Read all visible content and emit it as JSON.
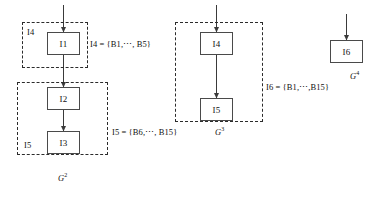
{
  "diagram": {
    "nodes": [
      {
        "id": "node-i1",
        "label": "I1",
        "x": 47,
        "y": 32,
        "w": 33,
        "h": 23
      },
      {
        "id": "node-i2",
        "label": "I2",
        "x": 47,
        "y": 87,
        "w": 33,
        "h": 23
      },
      {
        "id": "node-i3",
        "label": "I3",
        "x": 47,
        "y": 131,
        "w": 33,
        "h": 23
      },
      {
        "id": "node-i4",
        "label": "I4",
        "x": 200,
        "y": 32,
        "w": 33,
        "h": 23
      },
      {
        "id": "node-i5",
        "label": "I5",
        "x": 200,
        "y": 98,
        "w": 33,
        "h": 23
      },
      {
        "id": "node-i6",
        "label": "I6",
        "x": 330,
        "y": 40,
        "w": 33,
        "h": 23
      }
    ],
    "groups": [
      {
        "id": "group-g2-upper",
        "x": 22,
        "y": 22,
        "w": 66,
        "h": 46
      },
      {
        "id": "group-g2-lower",
        "x": 17,
        "y": 82,
        "w": 91,
        "h": 73
      },
      {
        "id": "group-g3",
        "x": 175,
        "y": 22,
        "w": 88,
        "h": 100
      }
    ],
    "inner_labels": [
      {
        "id": "inner-label-i4",
        "text": "I4",
        "x": 27,
        "y": 27
      },
      {
        "id": "inner-label-i5",
        "text": "I5",
        "x": 24,
        "y": 140
      }
    ],
    "set_labels": [
      {
        "id": "set-label-i4",
        "text": "I4 = {B1,⋯, B5}",
        "x": 90,
        "y": 39
      },
      {
        "id": "set-label-i5",
        "text": "I5 = {B6,⋯, B15}",
        "x": 112,
        "y": 127
      },
      {
        "id": "set-label-i6",
        "text": "I6 = {B1,⋯,B15}",
        "x": 266,
        "y": 82
      }
    ],
    "captions": [
      {
        "id": "caption-g2",
        "text": "G",
        "sup": "2",
        "x": 58,
        "y": 172
      },
      {
        "id": "caption-g3",
        "text": "G",
        "sup": "3",
        "x": 215,
        "y": 126
      },
      {
        "id": "caption-g4",
        "text": "G",
        "sup": "4",
        "x": 350,
        "y": 70
      }
    ],
    "arrows": [
      {
        "id": "arrow-into-i1",
        "x1": 63.5,
        "y1": 5,
        "x2": 63.5,
        "y2": 32
      },
      {
        "id": "arrow-i1-to-i2",
        "x1": 63.5,
        "y1": 55,
        "x2": 63.5,
        "y2": 87
      },
      {
        "id": "arrow-i2-to-i3",
        "x1": 63.5,
        "y1": 110,
        "x2": 63.5,
        "y2": 131
      },
      {
        "id": "arrow-into-i4",
        "x1": 216.5,
        "y1": 5,
        "x2": 216.5,
        "y2": 32
      },
      {
        "id": "arrow-i4-to-i5",
        "x1": 216.5,
        "y1": 55,
        "x2": 216.5,
        "y2": 98
      },
      {
        "id": "arrow-into-i6",
        "x1": 346.5,
        "y1": 14,
        "x2": 346.5,
        "y2": 40
      }
    ]
  },
  "colors": {
    "node_border": "#4a4a4a",
    "group_border": "#2b2b2b",
    "arrow": "#3a3a3a",
    "text": "#111111",
    "background": "#ffffff"
  }
}
